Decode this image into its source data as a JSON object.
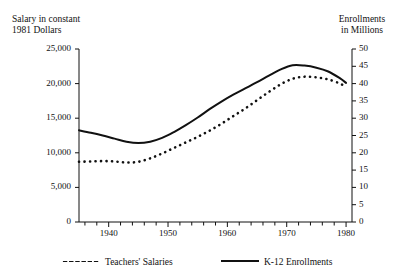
{
  "chart_data": {
    "type": "line",
    "title": "",
    "xlabel": "",
    "ylabel": "Salary in constant\n1981 Dollars",
    "y2label": "Enrollments\nin Millions",
    "grid": false,
    "legend_position": "bottom",
    "xlim": [
      1935,
      1981
    ],
    "ylim": [
      0,
      25000
    ],
    "y2lim": [
      0,
      50
    ],
    "x_tick_labels": [
      "1940",
      "1950",
      "1960",
      "1970",
      "1980"
    ],
    "x_tick_values": [
      1940,
      1950,
      1960,
      1970,
      1980
    ],
    "x_minor_tick_step": 2,
    "y_tick_labels": [
      "0",
      "5,000",
      "10,000",
      "15,000",
      "20,000",
      "25,000"
    ],
    "y_tick_values": [
      0,
      5000,
      10000,
      15000,
      20000,
      25000
    ],
    "y2_tick_labels": [
      "0",
      "5",
      "10",
      "15",
      "20",
      "25",
      "30",
      "35",
      "40",
      "45",
      "50"
    ],
    "y2_tick_values": [
      0,
      5,
      10,
      15,
      20,
      25,
      30,
      35,
      40,
      45,
      50
    ],
    "x": [
      1935,
      1937,
      1939,
      1941,
      1943,
      1945,
      1947,
      1949,
      1951,
      1953,
      1955,
      1957,
      1959,
      1961,
      1963,
      1965,
      1967,
      1969,
      1971,
      1973,
      1975,
      1977,
      1979,
      1980
    ],
    "series": [
      {
        "name": "Teachers' Salaries",
        "axis": "left",
        "style": "dotted",
        "color": "#111111",
        "values": [
          8700,
          8750,
          8800,
          8750,
          8600,
          8700,
          9200,
          9900,
          10700,
          11500,
          12300,
          13200,
          14200,
          15300,
          16400,
          17600,
          18800,
          19900,
          20700,
          21000,
          20900,
          20600,
          20000,
          19500
        ]
      },
      {
        "name": "K-12 Enrollments",
        "axis": "right",
        "style": "solid",
        "color": "#111111",
        "values": [
          26.5,
          25.8,
          25.0,
          24.1,
          23.2,
          22.8,
          23.2,
          24.3,
          26.0,
          28.0,
          30.2,
          32.6,
          34.8,
          36.8,
          38.6,
          40.4,
          42.3,
          44.1,
          45.3,
          45.2,
          44.6,
          43.5,
          41.5,
          40.2
        ]
      }
    ],
    "legend": [
      {
        "name": "Teachers' Salaries",
        "style": "dotted"
      },
      {
        "name": "K-12 Enrollments",
        "style": "solid"
      }
    ]
  },
  "plot_geometry": {
    "left_axis_x": 79,
    "right_axis_x": 352,
    "top_y": 49,
    "bottom_y": 222
  }
}
